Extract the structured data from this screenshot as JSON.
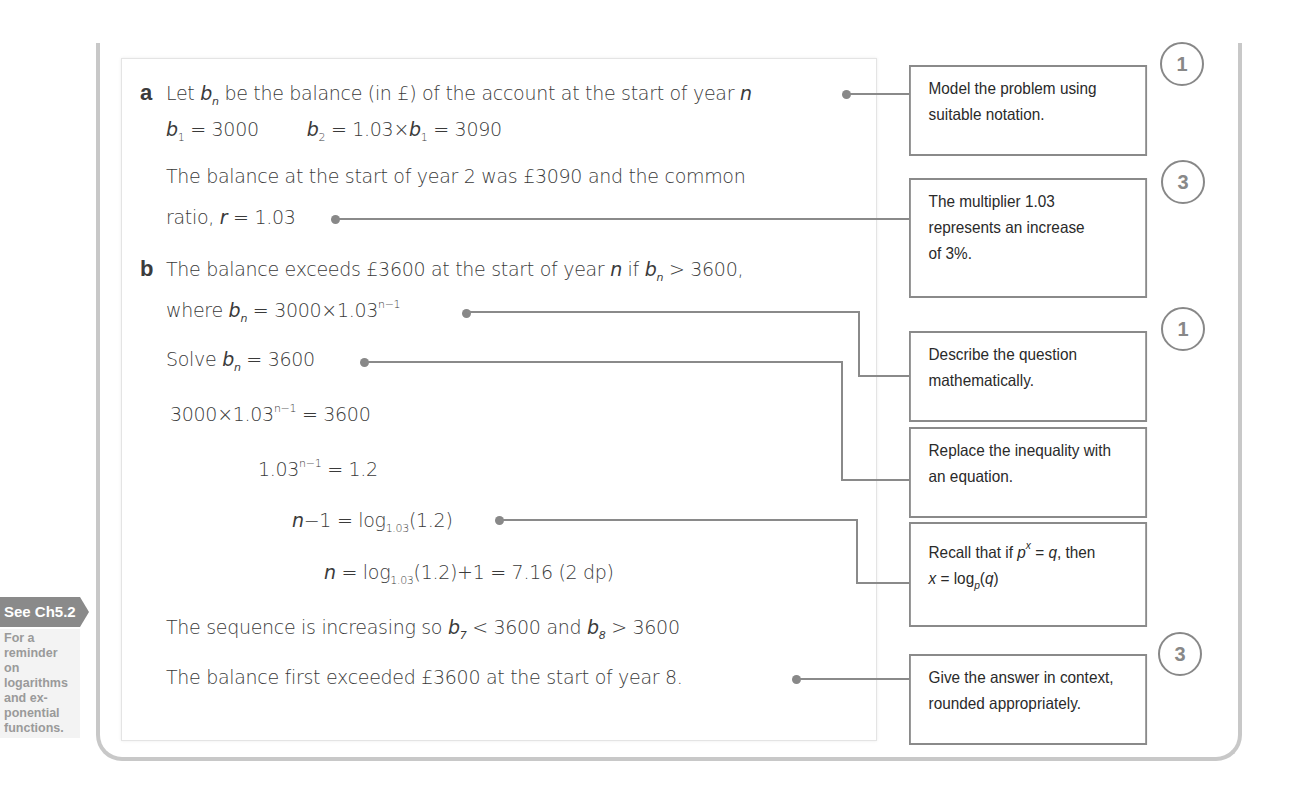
{
  "part_a": {
    "label": "a",
    "line1_pre": "Let ",
    "line1_var": "b",
    "line1_sub": "n",
    "line1_post": " be the balance (in £) of the account at the start of year ",
    "line1_n": "n",
    "line2_b1": "b",
    "line2_b1_sub": "1",
    "line2_b1_val": " = 3000",
    "line2_b2": "b",
    "line2_b2_sub": "2",
    "line2_b2_mid": " = 1.03×",
    "line2_b2_b1": "b",
    "line2_b2_b1_sub": "1",
    "line2_b2_val": " = 3090",
    "line3": "The balance at the start of year 2 was £3090 and the common",
    "line4_pre": "ratio, ",
    "line4_r": "r",
    "line4_post": " = 1.03"
  },
  "part_b": {
    "label": "b",
    "line1_pre": "The balance exceeds £3600 at the start of year ",
    "line1_n": "n",
    "line1_mid": " if ",
    "line1_b": "b",
    "line1_sub": "n",
    "line1_post": " > 3600,",
    "line2_pre": "where ",
    "line2_b": "b",
    "line2_sub": "n",
    "line2_mid": " = 3000×1.03",
    "line2_sup": "n−1",
    "line3_pre": "Solve ",
    "line3_b": "b",
    "line3_sub": "n",
    "line3_post": " = 3600",
    "line4_pre": "3000×1.03",
    "line4_sup": "n−1",
    "line4_post": " = 3600",
    "line5_pre": "1.03",
    "line5_sup": "n−1",
    "line5_post": " = 1.2",
    "line6_n": "n",
    "line6_mid": "−1 = log",
    "line6_sub": "1.03",
    "line6_post": "(1.2)",
    "line7_n": "n",
    "line7_mid": " = log",
    "line7_sub": "1.03",
    "line7_post": "(1.2)+1 = 7.16 (2 dp)",
    "line8_pre": "The sequence is increasing so ",
    "line8_b7": "b",
    "line8_b7_sub": "7",
    "line8_mid": " < 3600 and ",
    "line8_b8": "b",
    "line8_b8_sub": "8",
    "line8_post": " > 3600",
    "line9": "The balance first exceeded £3600 at the start of year 8."
  },
  "notes": [
    {
      "badge": "1",
      "lines": [
        "Model the problem using",
        "suitable notation."
      ]
    },
    {
      "badge": "3",
      "lines": [
        "The multiplier 1.03",
        "represents an increase",
        "of 3%."
      ]
    },
    {
      "badge": "1",
      "lines": [
        "Describe the question",
        "mathematically."
      ]
    },
    {
      "badge": "",
      "lines": [
        "Replace the inequality with",
        "an equation."
      ]
    },
    {
      "badge": "",
      "line1_pre": "Recall that if ",
      "line1_p": "p",
      "line1_x": "x",
      "line1_post": " = ",
      "line1_q": "q",
      "line1_end": ", then",
      "line2_x": "x",
      "line2_mid": " = log",
      "line2_sub": "p",
      "line2_open": "(",
      "line2_q": "q",
      "line2_close": ")"
    },
    {
      "badge": "3",
      "lines": [
        "Give the answer in context,",
        "rounded appropriately."
      ]
    }
  ],
  "sidebar": {
    "tab_label": "See Ch5.2",
    "note_lines": [
      "For a",
      "reminder",
      "on",
      "logarithms",
      "and ex-",
      "ponential",
      "functions."
    ]
  },
  "colors": {
    "frame": "#c8c8c8",
    "connector": "#8a8a8a",
    "tab_bg": "#8a8a8a",
    "text": "#3a3a3a"
  }
}
